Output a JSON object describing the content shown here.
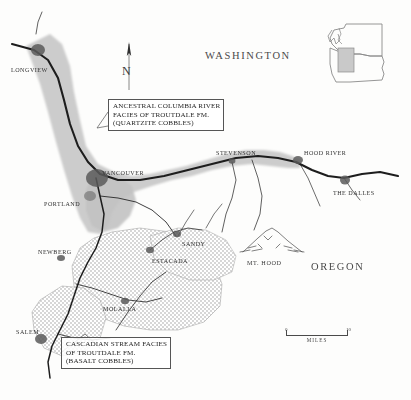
{
  "map": {
    "title": "Troutdale Formation facies map",
    "states": [
      {
        "name": "WASHINGTON",
        "x": 205,
        "y": 57
      },
      {
        "name": "OREGON",
        "x": 311,
        "y": 268
      }
    ],
    "cities": [
      {
        "name": "LONGVIEW",
        "label_x": 11,
        "label_y": 67,
        "dot_x": 36,
        "dot_y": 52
      },
      {
        "name": "VANCOUVER",
        "label_x": 102,
        "label_y": 170,
        "dot_x": 96,
        "dot_y": 177
      },
      {
        "name": "PORTLAND",
        "label_x": 44,
        "label_y": 201,
        "dot_x": 89,
        "dot_y": 196
      },
      {
        "name": "NEWBERG",
        "label_x": 38,
        "label_y": 249,
        "dot_x": 60,
        "dot_y": 257
      },
      {
        "name": "SALEM",
        "label_x": 16,
        "label_y": 329,
        "dot_x": 40,
        "dot_y": 338
      },
      {
        "name": "MOLALLA",
        "label_x": 103,
        "label_y": 306,
        "dot_x": 124,
        "dot_y": 300
      },
      {
        "name": "ESTACADA",
        "label_x": 152,
        "label_y": 258,
        "dot_x": 150,
        "dot_y": 250
      },
      {
        "name": "SANDY",
        "label_x": 182,
        "label_y": 241,
        "dot_x": 177,
        "dot_y": 235
      },
      {
        "name": "STEVENSON",
        "label_x": 216,
        "label_y": 150,
        "dot_x": 231,
        "dot_y": 160
      },
      {
        "name": "HOOD RIVER",
        "label_x": 304,
        "label_y": 150,
        "dot_x": 300,
        "dot_y": 160
      },
      {
        "name": "THE DALLES",
        "label_x": 333,
        "label_y": 190,
        "dot_x": 344,
        "dot_y": 180
      }
    ],
    "peaks": [
      {
        "name": "MT. HOOD",
        "label_x": 247,
        "label_y": 259,
        "symbol_x": 270,
        "symbol_y": 243
      }
    ],
    "callouts": [
      {
        "id": "quartzite",
        "lines": [
          "ANCESTRAL COLUMBIA RIVER",
          "FACIES OF TROUTDALE FM.",
          "(QUARTZITE COBBLES)"
        ]
      },
      {
        "id": "basalt",
        "lines": [
          "CASCADIAN STREAM FACIES",
          "OF TROUTDALE FM.",
          "(BASALT COBBLES)"
        ]
      }
    ],
    "north_arrow": {
      "letter": "N"
    },
    "scale": {
      "min": "0",
      "max": "10",
      "units": "MILES"
    },
    "inset": {
      "description": "Washington and Oregon state outline with study area box"
    },
    "colors": {
      "quartzite_facies": "#c9c9c9",
      "basalt_facies_dots": "#8d8d8d",
      "river": "#1d1d1d",
      "urban": "#5a5a5a",
      "background": "#fdfdfc",
      "text": "#2a2a2a"
    }
  }
}
